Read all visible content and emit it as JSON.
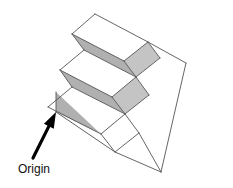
{
  "figure": {
    "background_color": "#ffffff"
  },
  "annotation": {
    "label_text": "Origin",
    "label_x": 18,
    "label_y": 173,
    "label_font_size": 12,
    "label_color": "#111111",
    "arrow_color": "#000000",
    "arrow_tail_x": 33,
    "arrow_tail_y": 158,
    "arrow_tip_x": 56,
    "arrow_tip_y": 112,
    "arrow_width": 3.2,
    "arrowhead_length": 16,
    "arrowhead_width": 11
  },
  "solid": {
    "outline_color": "#555555",
    "outline_width": 0.9,
    "face_colors": {
      "riser_gray": "#b3b3b3",
      "tread_white": "#ffffff",
      "top_white": "#fdfdfd",
      "right_white": "#ffffff",
      "bevel_gray": "#c9c9c9",
      "left_edge_gray": "#a8a8a8"
    },
    "step_count": 3,
    "faces": [
      {
        "name": "top-step-top-face",
        "kind": "tread",
        "fill": "#ffffff",
        "points": "95,14 148,42 124,61 72,34"
      },
      {
        "name": "top-step-bevel-face",
        "kind": "bevel",
        "fill": "#c4c4c4",
        "points": "148,42 160,58 136,77 124,61"
      },
      {
        "name": "top-step-riser-face",
        "kind": "riser",
        "fill": "#b0b0b0",
        "points": "72,34 124,61 136,77 84,50"
      },
      {
        "name": "mid-step-top-face",
        "kind": "tread",
        "fill": "#ffffff",
        "points": "84,50 136,77 112,97 60,70"
      },
      {
        "name": "mid-step-bevel-face",
        "kind": "bevel",
        "fill": "#c4c4c4",
        "points": "136,77 149,95 125,114 112,97"
      },
      {
        "name": "mid-step-riser-face",
        "kind": "riser",
        "fill": "#b0b0b0",
        "points": "60,70 112,97 125,114 72,87"
      },
      {
        "name": "bottom-step-top-face",
        "kind": "tread",
        "fill": "#ffffff",
        "points": "72,87 125,114 101,134 48,107"
      },
      {
        "name": "bottom-step-bevel-face",
        "kind": "bevel",
        "fill": "#c4c4c4",
        "points": "125,114 139,133 115,152 101,134"
      },
      {
        "name": "bottom-step-riser-face",
        "kind": "riser",
        "fill": "#b0b0b0",
        "points": "56,92 101,134 115,152 56,112"
      },
      {
        "name": "right-large-face",
        "kind": "right-side",
        "fill": "#ffffff",
        "points": "148,42 186,63 161,172 139,133 125,114 149,95 136,77 160,58"
      },
      {
        "name": "bottom-front-face",
        "kind": "front",
        "fill": "#ffffff",
        "points": "56,112 115,152 161,172 139,133 125,114 101,134"
      }
    ],
    "edges": [
      {
        "name": "edge-top-back-left",
        "d": "M 95,14 L 148,42"
      },
      {
        "name": "edge-top-left",
        "d": "M 95,14 L 72,34"
      },
      {
        "name": "edge-top-tread-front",
        "d": "M 72,34 L 124,61"
      },
      {
        "name": "edge-top-tread-right",
        "d": "M 124,61 L 148,42"
      },
      {
        "name": "edge-top-bevel-right",
        "d": "M 148,42 L 160,58"
      },
      {
        "name": "edge-top-bevel-bottom",
        "d": "M 160,58 L 136,77"
      },
      {
        "name": "edge-top-riser-right",
        "d": "M 124,61 L 136,77"
      },
      {
        "name": "edge-top-riser-left",
        "d": "M 72,34 L 84,50"
      },
      {
        "name": "edge-mid-tread-back",
        "d": "M 84,50 L 136,77"
      },
      {
        "name": "edge-mid-tread-front",
        "d": "M 60,70 L 112,97"
      },
      {
        "name": "edge-mid-tread-left",
        "d": "M 84,50 L 60,70"
      },
      {
        "name": "edge-mid-tread-right",
        "d": "M 112,97 L 136,77"
      },
      {
        "name": "edge-mid-bevel-right",
        "d": "M 136,77 L 149,95"
      },
      {
        "name": "edge-mid-bevel-bottom",
        "d": "M 149,95 L 125,114"
      },
      {
        "name": "edge-mid-riser-right",
        "d": "M 112,97 L 125,114"
      },
      {
        "name": "edge-mid-riser-left",
        "d": "M 60,70 L 72,87"
      },
      {
        "name": "edge-bot-tread-back",
        "d": "M 72,87 L 125,114"
      },
      {
        "name": "edge-bot-tread-front",
        "d": "M 48,107 L 101,134"
      },
      {
        "name": "edge-bot-tread-left",
        "d": "M 72,87 L 48,107"
      },
      {
        "name": "edge-bot-tread-right",
        "d": "M 101,134 L 125,114"
      },
      {
        "name": "edge-bot-bevel-right",
        "d": "M 125,114 L 139,133"
      },
      {
        "name": "edge-bot-bevel-bottom",
        "d": "M 139,133 L 115,152"
      },
      {
        "name": "edge-bot-riser-right",
        "d": "M 101,134 L 115,152"
      },
      {
        "name": "edge-origin-vertical",
        "d": "M 56,92 L 56,112"
      },
      {
        "name": "edge-front-bottom-left",
        "d": "M 56,112 L 115,152"
      },
      {
        "name": "edge-front-bottom-right",
        "d": "M 115,152 L 161,172"
      },
      {
        "name": "edge-right-long-slope",
        "d": "M 186,63 L 161,172"
      },
      {
        "name": "edge-right-top-slope",
        "d": "M 148,42 L 186,63"
      },
      {
        "name": "edge-right-bottom-join",
        "d": "M 161,172 L 139,133"
      }
    ]
  }
}
